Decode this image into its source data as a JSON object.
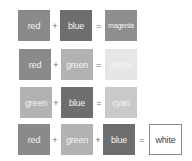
{
  "colors": {
    "red": "#8a8a8a",
    "blue": "#6e6e6e",
    "magenta": "#8e8e8e",
    "green": "#b2b2b2",
    "yellow": "#e6e6e6",
    "cyan": "#c9c9c9",
    "white": "#ffffff"
  },
  "rows": [
    {
      "terms": [
        "red",
        "blue"
      ],
      "result": "magenta"
    },
    {
      "terms": [
        "red",
        "green"
      ],
      "result": "yellow"
    },
    {
      "terms": [
        "green",
        "blue"
      ],
      "result": "cyan"
    },
    {
      "terms": [
        "red",
        "green",
        "blue"
      ],
      "result": "white"
    }
  ],
  "operators": {
    "plus": "+",
    "equals": "="
  },
  "labels": {
    "r1_a": "red",
    "r1_b": "blue",
    "r1_res": "magenta",
    "r2_a": "red",
    "r2_b": "green",
    "r2_res": "yellow",
    "r3_a": "green",
    "r3_b": "blue",
    "r3_res": "cyan",
    "r4_a": "red",
    "r4_b": "green",
    "r4_c": "blue",
    "r4_res": "white"
  }
}
